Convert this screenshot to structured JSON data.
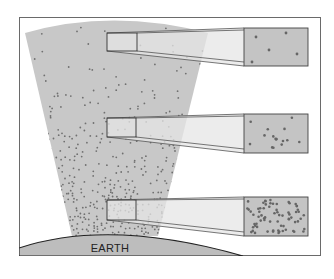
{
  "diagram": {
    "earth_label": "EARTH",
    "colors": {
      "frame": "#6a6a6a",
      "background": "#ffffff",
      "atmosphere": "#c8c8c8",
      "particle": "#707070",
      "earth_fill": "#bdbdbd",
      "earth_outline": "#222222",
      "zoom_beam": "#e6e6e6",
      "box_stroke": "#444444",
      "magnified_fill": "#c4c4c4"
    },
    "magnified_views": [
      {
        "level": "high-altitude",
        "density": "sparse",
        "particle_count": 5
      },
      {
        "level": "mid-altitude",
        "density": "medium",
        "particle_count": 16
      },
      {
        "level": "low-altitude",
        "density": "dense",
        "particle_count": 70
      }
    ]
  }
}
